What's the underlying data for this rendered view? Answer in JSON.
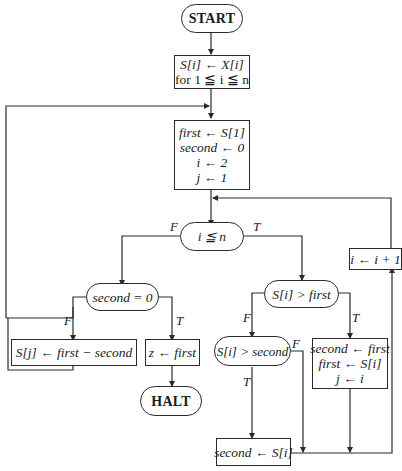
{
  "diagram": {
    "type": "flowchart",
    "nodes": {
      "start": {
        "shape": "terminal",
        "text": "START"
      },
      "init_s": {
        "shape": "process",
        "lines": [
          "S[i] ← X[i]",
          "for 1 ≦ i ≦ n"
        ]
      },
      "init_vars": {
        "shape": "process",
        "lines": [
          "first ← S[1]",
          "second ← 0",
          "i ← 2",
          "j ← 1"
        ]
      },
      "loop_cond": {
        "shape": "decision",
        "text": "i ≦ n"
      },
      "inc_i": {
        "shape": "process",
        "text": "i ← i + 1"
      },
      "second_zero": {
        "shape": "decision",
        "text": "second = 0"
      },
      "gt_first": {
        "shape": "decision",
        "text": "S[i] > first"
      },
      "assign_sj": {
        "shape": "process",
        "text": "S[j] ← first − second"
      },
      "z_first": {
        "shape": "process",
        "text": "z ← first"
      },
      "gt_second": {
        "shape": "decision",
        "text": "S[i] > second"
      },
      "swap": {
        "shape": "process",
        "lines": [
          "second ← first",
          "first ← S[i]",
          "j ← i"
        ]
      },
      "halt": {
        "shape": "terminal",
        "text": "HALT"
      },
      "second_si": {
        "shape": "process",
        "text": "second ← S[i]"
      }
    },
    "branch_labels": {
      "loop_false": "F",
      "loop_true": "T",
      "second_zero_false": "F",
      "second_zero_true": "T",
      "gt_first_false": "F",
      "gt_first_true": "T",
      "gt_second_false": "F",
      "gt_second_true": "T"
    },
    "edges": [
      [
        "start",
        "init_s"
      ],
      [
        "init_s",
        "init_vars"
      ],
      [
        "init_vars",
        "loop_cond"
      ],
      [
        "loop_cond",
        "second_zero",
        "F"
      ],
      [
        "loop_cond",
        "gt_first",
        "T"
      ],
      [
        "second_zero",
        "assign_sj",
        "F"
      ],
      [
        "second_zero",
        "z_first",
        "T"
      ],
      [
        "assign_sj",
        "init_vars"
      ],
      [
        "z_first",
        "halt"
      ],
      [
        "gt_first",
        "gt_second",
        "F"
      ],
      [
        "gt_first",
        "swap",
        "T"
      ],
      [
        "gt_second",
        "second_si",
        "T"
      ],
      [
        "gt_second",
        "inc_i",
        "F"
      ],
      [
        "swap",
        "inc_i"
      ],
      [
        "second_si",
        "inc_i"
      ],
      [
        "inc_i",
        "loop_cond"
      ]
    ]
  }
}
